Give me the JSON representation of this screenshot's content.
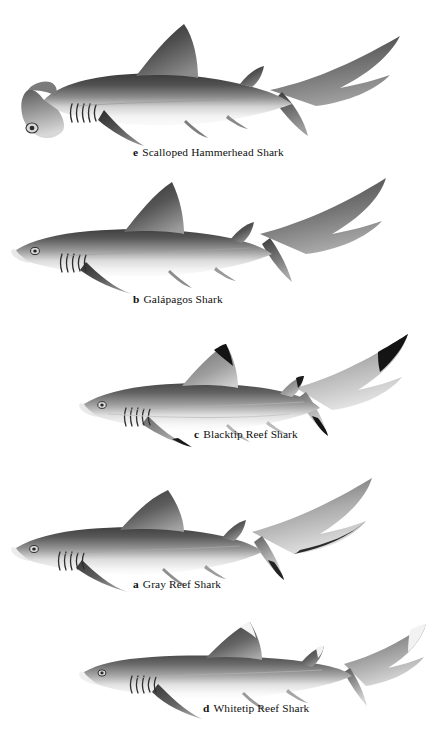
{
  "plate": {
    "title": "Shark Species Identification Plate",
    "background_color": "#ffffff",
    "ink_color": "#1a1a1a",
    "figure_count": 5
  },
  "figures": [
    {
      "id": "hammerhead",
      "letter": "e",
      "name": "Scalloped Hammerhead Shark",
      "order_on_plate": 1,
      "body_tone_dark": "#4a4a4a",
      "body_tone_light": "#f2f2f2",
      "distinctive_feature": "cephalofoil-hammer-head"
    },
    {
      "id": "galapagos",
      "letter": "b",
      "name": "Galápagos Shark",
      "order_on_plate": 2,
      "body_tone_dark": "#555555",
      "body_tone_light": "#f4f4f4",
      "distinctive_feature": "tall-pointed-first-dorsal"
    },
    {
      "id": "blacktip",
      "letter": "c",
      "name": "Blacktip Reef Shark",
      "order_on_plate": 3,
      "body_tone_dark": "#5a5a5a",
      "body_tone_light": "#f6f6f6",
      "distinctive_feature": "black-fin-tips"
    },
    {
      "id": "gray",
      "letter": "a",
      "name": "Gray Reef Shark",
      "order_on_plate": 4,
      "body_tone_dark": "#4f4f4f",
      "body_tone_light": "#f4f4f4",
      "distinctive_feature": "dark-trailing-edge-caudal-fin"
    },
    {
      "id": "whitetip",
      "letter": "d",
      "name": "Whitetip Reef Shark",
      "order_on_plate": 5,
      "body_tone_dark": "#5d5d5d",
      "body_tone_light": "#f7f7f7",
      "distinctive_feature": "white-tipped-dorsal-and-caudal"
    }
  ]
}
